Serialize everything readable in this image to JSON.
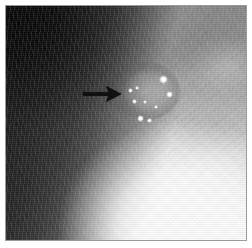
{
  "figure": {
    "modality_appearance": "grayscale radiograph / mammographic film scan",
    "canvas": {
      "width": 252,
      "height": 248,
      "background_color": "#ffffff"
    },
    "plate": {
      "left": 5,
      "top": 5,
      "width": 242,
      "height": 236,
      "border_color": "#9b9b9b",
      "border_width": 1
    },
    "image_area": {
      "left": 0,
      "top": 0,
      "width": 240,
      "height": 234
    },
    "tone": {
      "darkest_region": "upper-left corner",
      "darkest_color": "#0d0d0d",
      "midtone_color": "#989898",
      "brightest_region": "lower-right",
      "brightest_color": "#ffffff"
    }
  },
  "annotations": {
    "arrow": {
      "name": "roi-arrow",
      "direction": "right",
      "color": "#111111",
      "x": 76,
      "y": 78,
      "width": 40,
      "height": 20,
      "tip_x": 114,
      "tip_y": 88,
      "tail_x": 78,
      "tail_y": 88,
      "points_to": "lesion"
    }
  },
  "features": {
    "lesion": {
      "name": "lesion-halo",
      "x": 108,
      "y": 56,
      "width": 66,
      "height": 58,
      "description": "rounded lucent mass with internal bright foci"
    },
    "calcifications": [
      {
        "name": "calcification-1",
        "x": 157,
        "y": 73,
        "size": 9,
        "brightness": "#ffffff"
      },
      {
        "name": "calcification-2",
        "x": 163,
        "y": 88,
        "size": 7,
        "brightness": "#ffffff"
      },
      {
        "name": "calcification-3",
        "x": 124,
        "y": 84,
        "size": 5,
        "brightness": "#f5f5f5"
      },
      {
        "name": "calcification-4",
        "x": 131,
        "y": 82,
        "size": 4,
        "brightness": "#f2f2f2"
      },
      {
        "name": "calcification-5",
        "x": 128,
        "y": 95,
        "size": 5,
        "brightness": "#f7f7f7"
      },
      {
        "name": "calcification-6",
        "x": 139,
        "y": 96,
        "size": 4,
        "brightness": "#efefef"
      },
      {
        "name": "calcification-7",
        "x": 134,
        "y": 112,
        "size": 7,
        "brightness": "#ffffff"
      },
      {
        "name": "calcification-8",
        "x": 143,
        "y": 114,
        "size": 5,
        "brightness": "#fafafa"
      },
      {
        "name": "calcification-9",
        "x": 150,
        "y": 101,
        "size": 4,
        "brightness": "#ededed"
      }
    ],
    "dark_wedge": {
      "name": "dark-wedge",
      "description": "dark triangular area occupying the upper-left corner with an oblique boundary"
    },
    "bright_flare": {
      "name": "bright-flare",
      "description": "broad overexposed white region in the lower-right quadrant"
    }
  }
}
